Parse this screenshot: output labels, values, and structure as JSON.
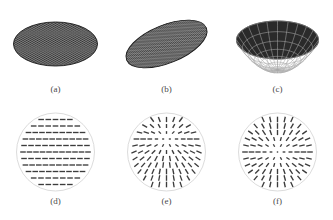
{
  "figure": {
    "background_color": "#ffffff",
    "mesh_fill_color": "#2a2a2a",
    "mesh_line_color": "#a8a8a8",
    "outline_color": "#dcdcdc",
    "dash_color": "#3c3c3c",
    "caption_color": "#4a4a4a"
  },
  "panels": [
    {
      "id": "a",
      "caption": "(a)",
      "kind": "mesh-ellipse",
      "description": "flat circular mesh disc viewed in perspective",
      "cx": 55.5,
      "cy": 44,
      "rx": 42,
      "ry": 22,
      "rotation_deg": 0,
      "mesh_spacing": 3.6,
      "mesh_angle_deg": 45
    },
    {
      "id": "b",
      "caption": "(b)",
      "kind": "mesh-ellipse",
      "description": "tilted mesh disc rotated about the view axis",
      "cx": 55.5,
      "cy": 44,
      "rx": 43,
      "ry": 19,
      "rotation_deg": -22,
      "mesh_spacing": 3.6,
      "mesh_angle_deg": 45
    },
    {
      "id": "c",
      "caption": "(c)",
      "kind": "mesh-bowl",
      "description": "concave paraboloid dish with curved grid",
      "cx": 55.5,
      "cy": 40,
      "rx": 41,
      "ry": 19,
      "depth": 30,
      "rings": 7,
      "spokes": 24
    },
    {
      "id": "d",
      "caption": "(d)",
      "kind": "quiver-circle",
      "description": "uniform horizontal orientation field",
      "cx": 55.5,
      "cy": 42,
      "radius": 39,
      "field": "uniform",
      "angle_deg": 0,
      "rows": 11,
      "dash_length": 5.6
    },
    {
      "id": "e",
      "caption": "(e)",
      "kind": "quiver-circle",
      "description": "radial field with focus offset above centre",
      "cx": 55.5,
      "cy": 42,
      "radius": 39,
      "field": "radial-offset",
      "focus_dx": 0,
      "focus_dy": -13,
      "rows": 11,
      "dash_length": 5.6
    },
    {
      "id": "f",
      "caption": "(f)",
      "kind": "quiver-circle",
      "description": "symmetric radial starburst field about centre",
      "cx": 55.5,
      "cy": 42,
      "radius": 39,
      "field": "radial",
      "focus_dx": 0,
      "focus_dy": 0,
      "rows": 11,
      "dash_length": 5.6
    }
  ]
}
